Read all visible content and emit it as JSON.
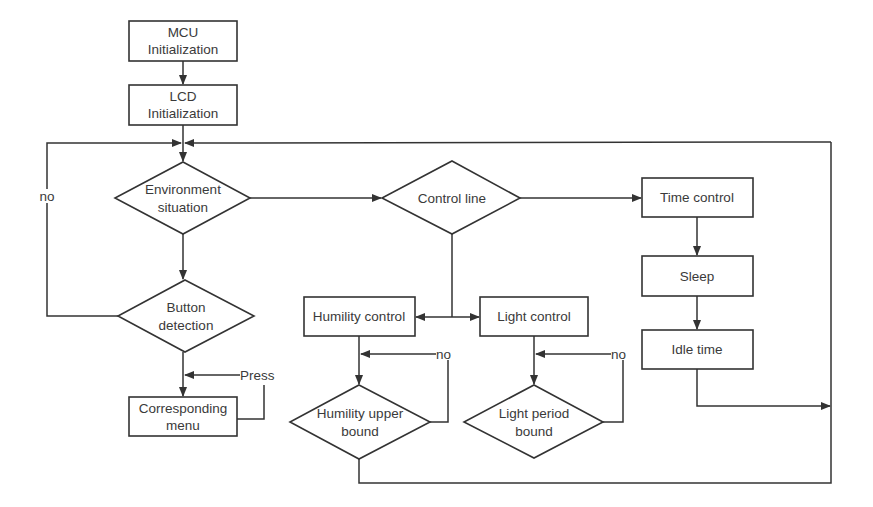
{
  "diagram": {
    "type": "flowchart",
    "colors": {
      "stroke": "#333333",
      "text": "#3a3a3a",
      "background": "#ffffff"
    },
    "nodes": {
      "mcu_init": {
        "shape": "rectangle",
        "line1": "MCU",
        "line2": "Initialization"
      },
      "lcd_init": {
        "shape": "rectangle",
        "line1": "LCD",
        "line2": "Initialization"
      },
      "environment": {
        "shape": "diamond",
        "line1": "Environment",
        "line2": "situation"
      },
      "button_detection": {
        "shape": "diamond",
        "line1": "Button",
        "line2": "detection"
      },
      "corresponding_menu": {
        "shape": "rectangle",
        "line1": "Corresponding",
        "line2": "menu"
      },
      "control_line": {
        "shape": "diamond",
        "label": "Control line"
      },
      "humility_control": {
        "shape": "rectangle",
        "label": "Humility control"
      },
      "light_control": {
        "shape": "rectangle",
        "label": "Light control"
      },
      "humility_upper_bound": {
        "shape": "diamond",
        "line1": "Humility upper",
        "line2": "bound"
      },
      "light_period_bound": {
        "shape": "diamond",
        "line1": "Light period",
        "line2": "bound"
      },
      "time_control": {
        "shape": "rectangle",
        "label": "Time control"
      },
      "sleep": {
        "shape": "rectangle",
        "label": "Sleep"
      },
      "idle_time": {
        "shape": "rectangle",
        "label": "Idle time"
      }
    },
    "edge_labels": {
      "button_no": "no",
      "press": "Press",
      "humility_no": "no",
      "light_no": "no"
    },
    "edges": [
      {
        "from": "MCU Initialization",
        "to": "LCD Initialization"
      },
      {
        "from": "LCD Initialization",
        "to": "Environment situation"
      },
      {
        "from": "Environment situation",
        "to": "Button detection"
      },
      {
        "from": "Button detection",
        "to": "Environment situation",
        "label": "no"
      },
      {
        "from": "Button detection",
        "to": "Corresponding menu"
      },
      {
        "from": "Corresponding menu",
        "to": "Corresponding menu",
        "label": "Press"
      },
      {
        "from": "Environment situation",
        "to": "Control line"
      },
      {
        "from": "Control line",
        "to": "Time control"
      },
      {
        "from": "Control line",
        "to": "Humility control"
      },
      {
        "from": "Control line",
        "to": "Light control"
      },
      {
        "from": "Humility control",
        "to": "Humility upper bound"
      },
      {
        "from": "Humility upper bound",
        "to": "Humility upper bound",
        "label": "no"
      },
      {
        "from": "Light control",
        "to": "Light period bound"
      },
      {
        "from": "Light period bound",
        "to": "Light period bound",
        "label": "no"
      },
      {
        "from": "Time control",
        "to": "Sleep"
      },
      {
        "from": "Sleep",
        "to": "Idle time"
      },
      {
        "from": "Idle time",
        "to": "Environment situation"
      },
      {
        "from": "Humility upper bound",
        "to": "Environment situation"
      }
    ]
  }
}
